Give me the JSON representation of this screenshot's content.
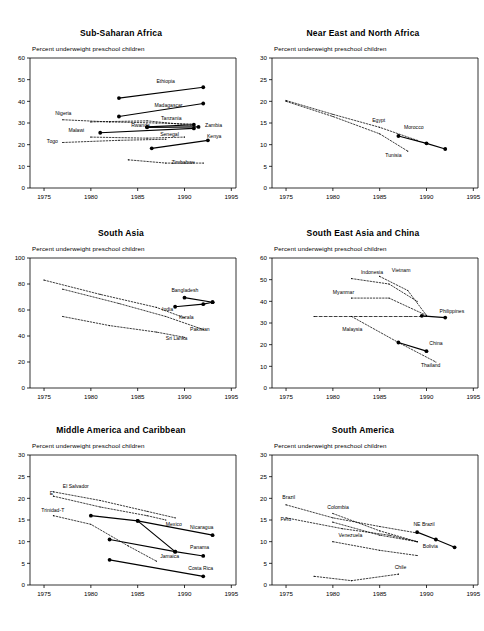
{
  "figure": {
    "y_axis_note": "Percent underweight preschool children",
    "x_ticks": [
      "1975",
      "1980",
      "1985",
      "1990",
      "1995"
    ],
    "xlim": [
      1973.5,
      1995.5
    ],
    "colors": {
      "ink": "#000000",
      "paper": "#ffffff"
    }
  },
  "chart_data": [
    {
      "type": "line",
      "title": "Sub-Saharan Africa",
      "xlabel": "",
      "ylabel": "Percent underweight preschool children",
      "xlim": [
        1973.5,
        1995.5
      ],
      "ylim": [
        0,
        60
      ],
      "yticks": [
        0,
        10,
        20,
        30,
        40,
        50,
        60
      ],
      "xticks": [
        1975,
        1980,
        1985,
        1990,
        1995
      ],
      "grid": false,
      "legend": "inline-labels",
      "series": [
        {
          "name": "Ethiopia",
          "style": "solid",
          "x": [
            1983,
            1992
          ],
          "values": [
            41.5,
            46.5
          ]
        },
        {
          "name": "Madagascar",
          "style": "solid",
          "x": [
            1983,
            1992
          ],
          "values": [
            33.0,
            39.0
          ]
        },
        {
          "name": "Tanzania",
          "style": "dotted",
          "x": [
            1980,
            1986,
            1991
          ],
          "values": [
            30.5,
            31.0,
            28.8
          ]
        },
        {
          "name": "Rwanda",
          "style": "solid",
          "x": [
            1986,
            1991
          ],
          "values": [
            28.2,
            29.2
          ]
        },
        {
          "name": "Zambia",
          "style": "solid",
          "x": [
            1986,
            1991.5
          ],
          "values": [
            28.0,
            28.2
          ]
        },
        {
          "name": "Nigeria",
          "style": "dotted",
          "x": [
            1977,
            1982,
            1987,
            1991
          ],
          "values": [
            31.5,
            30.5,
            30.0,
            29.5
          ]
        },
        {
          "name": "Malawi",
          "style": "solid",
          "x": [
            1981,
            1991
          ],
          "values": [
            25.5,
            27.5
          ]
        },
        {
          "name": "Senegal",
          "style": "dotted",
          "x": [
            1980,
            1986,
            1990
          ],
          "values": [
            23.5,
            23.0,
            23.5
          ]
        },
        {
          "name": "Kenya",
          "style": "solid",
          "x": [
            1986.5,
            1992.5
          ],
          "values": [
            18.3,
            22.0
          ]
        },
        {
          "name": "Togo",
          "style": "dotted",
          "x": [
            1977,
            1983,
            1988
          ],
          "values": [
            21.0,
            22.0,
            22.5
          ]
        },
        {
          "name": "Zimbabwe",
          "style": "dotted",
          "x": [
            1984,
            1988,
            1992
          ],
          "values": [
            13.0,
            11.5,
            11.5
          ]
        }
      ]
    },
    {
      "type": "line",
      "title": "Near East and North Africa",
      "xlabel": "",
      "ylabel": "Percent underweight preschool children",
      "xlim": [
        1973.5,
        1995.5
      ],
      "ylim": [
        0,
        30
      ],
      "yticks": [
        0,
        5,
        10,
        15,
        20,
        25,
        30
      ],
      "xticks": [
        1975,
        1980,
        1985,
        1990,
        1995
      ],
      "grid": false,
      "legend": "inline-labels",
      "series": [
        {
          "name": "Egypt",
          "style": "dotted",
          "x": [
            1975,
            1980,
            1985,
            1989
          ],
          "values": [
            20.2,
            17.0,
            14.0,
            11.0
          ]
        },
        {
          "name": "Morocco",
          "style": "solid",
          "x": [
            1987,
            1990,
            1992
          ],
          "values": [
            12.0,
            10.3,
            9.0
          ]
        },
        {
          "name": "Tunisia",
          "style": "dotted",
          "x": [
            1975,
            1980,
            1985,
            1988
          ],
          "values": [
            20.0,
            16.5,
            12.5,
            8.5
          ]
        }
      ]
    },
    {
      "type": "line",
      "title": "South Asia",
      "xlabel": "",
      "ylabel": "Percent underweight preschool children",
      "xlim": [
        1973.5,
        1995.5
      ],
      "ylim": [
        0,
        100
      ],
      "yticks": [
        0,
        20,
        40,
        60,
        80,
        100
      ],
      "xticks": [
        1975,
        1980,
        1985,
        1990,
        1995
      ],
      "grid": false,
      "legend": "inline-labels",
      "series": [
        {
          "name": "Bangladesh",
          "style": "solid",
          "x": [
            1990,
            1993
          ],
          "values": [
            69.5,
            66.0
          ]
        },
        {
          "name": "India",
          "style": "solid",
          "x": [
            1989,
            1992,
            1993
          ],
          "values": [
            62.5,
            64.5,
            66.0
          ]
        },
        {
          "name": "Kerala",
          "style": "dotted",
          "x": [
            1975,
            1981,
            1987,
            1990
          ],
          "values": [
            83.0,
            72.0,
            62.0,
            54.0
          ]
        },
        {
          "name": "Pakistan",
          "style": "dotted",
          "x": [
            1977,
            1983,
            1988,
            1992
          ],
          "values": [
            76.0,
            65.0,
            55.0,
            45.0
          ]
        },
        {
          "name": "Sri Lanka",
          "style": "dotted",
          "x": [
            1977,
            1982,
            1987,
            1990
          ],
          "values": [
            55.0,
            48.0,
            43.0,
            39.0
          ]
        }
      ]
    },
    {
      "type": "line",
      "title": "South East Asia and China",
      "xlabel": "",
      "ylabel": "Percent underweight preschool children",
      "xlim": [
        1973.5,
        1995.5
      ],
      "ylim": [
        0,
        60
      ],
      "yticks": [
        0,
        10,
        20,
        30,
        40,
        50,
        60
      ],
      "xticks": [
        1975,
        1980,
        1985,
        1990,
        1995
      ],
      "grid": false,
      "legend": "inline-labels",
      "series": [
        {
          "name": "Indonesia",
          "style": "dotted",
          "x": [
            1982,
            1986,
            1989
          ],
          "values": [
            50.5,
            48.0,
            40.0
          ]
        },
        {
          "name": "Vietnam",
          "style": "dotted",
          "x": [
            1985,
            1988,
            1990
          ],
          "values": [
            51.5,
            45.0,
            33.5
          ]
        },
        {
          "name": "Myanmar",
          "style": "dotted",
          "x": [
            1982,
            1986,
            1990
          ],
          "values": [
            41.5,
            41.5,
            33.5
          ]
        },
        {
          "name": "Philippines",
          "style": "solid",
          "x": [
            1989.5,
            1992
          ],
          "values": [
            33.3,
            32.5
          ]
        },
        {
          "name": "Malaysia",
          "style": "dashed",
          "x": [
            1978,
            1983,
            1988,
            1990
          ],
          "values": [
            33.0,
            33.0,
            33.0,
            33.0
          ]
        },
        {
          "name": "China",
          "style": "solid",
          "x": [
            1987,
            1990
          ],
          "values": [
            21.0,
            17.0
          ]
        },
        {
          "name": "Thailand",
          "style": "dotted",
          "x": [
            1982,
            1987,
            1991
          ],
          "values": [
            33.0,
            21.0,
            12.0
          ]
        }
      ]
    },
    {
      "type": "line",
      "title": "Middle America and Caribbean",
      "xlabel": "",
      "ylabel": "Percent underweight preschool children",
      "xlim": [
        1973.5,
        1995.5
      ],
      "ylim": [
        0,
        30
      ],
      "yticks": [
        0,
        5,
        10,
        15,
        20,
        25,
        30
      ],
      "xticks": [
        1975,
        1980,
        1985,
        1990,
        1995
      ],
      "grid": false,
      "legend": "inline-labels",
      "series": [
        {
          "name": "El Salvador",
          "style": "dotted",
          "x": [
            1976,
            1981,
            1986,
            1989
          ],
          "values": [
            21.5,
            19.5,
            17.0,
            15.5
          ]
        },
        {
          "name": "Mexico",
          "style": "dotted",
          "x": [
            1976,
            1981,
            1986,
            1988
          ],
          "values": [
            20.5,
            18.0,
            16.0,
            15.0
          ]
        },
        {
          "name": "Trinidad-T",
          "style": "dotted",
          "x": [
            1976,
            1980,
            1984,
            1987
          ],
          "values": [
            16.0,
            14.0,
            9.0,
            5.5
          ]
        },
        {
          "name": "Nicaragua",
          "style": "solid",
          "x": [
            1980,
            1985,
            1993
          ],
          "values": [
            16.0,
            14.8,
            11.5
          ]
        },
        {
          "name": "Panama",
          "style": "solid",
          "x": [
            1982,
            1989,
            1992
          ],
          "values": [
            10.5,
            7.7,
            6.7
          ]
        },
        {
          "name": "Jamaica",
          "style": "solid",
          "x": [
            1985,
            1989
          ],
          "values": [
            14.8,
            7.7
          ]
        },
        {
          "name": "Costa Rica",
          "style": "solid",
          "x": [
            1982,
            1992
          ],
          "values": [
            5.8,
            2.0
          ]
        }
      ]
    },
    {
      "type": "line",
      "title": "South America",
      "xlabel": "",
      "ylabel": "Percent underweight preschool children",
      "xlim": [
        1973.5,
        1995.5
      ],
      "ylim": [
        0,
        30
      ],
      "yticks": [
        0,
        5,
        10,
        15,
        20,
        25,
        30
      ],
      "xticks": [
        1975,
        1980,
        1985,
        1990,
        1995
      ],
      "grid": false,
      "legend": "inline-labels",
      "series": [
        {
          "name": "Brazil",
          "style": "dotted",
          "x": [
            1975,
            1980,
            1985,
            1989
          ],
          "values": [
            18.5,
            15.5,
            13.5,
            12.0
          ]
        },
        {
          "name": "Colombia",
          "style": "dotted",
          "x": [
            1980,
            1985,
            1989
          ],
          "values": [
            16.5,
            12.5,
            10.0
          ]
        },
        {
          "name": "Peru",
          "style": "dotted",
          "x": [
            1975,
            1981,
            1986,
            1989
          ],
          "values": [
            15.5,
            13.0,
            11.5,
            10.0
          ]
        },
        {
          "name": "Venezuela",
          "style": "dotted",
          "x": [
            1980,
            1985,
            1989
          ],
          "values": [
            10.0,
            8.0,
            6.8
          ]
        },
        {
          "name": "NE Brazil",
          "style": "solid",
          "x": [
            1989,
            1991,
            1993
          ],
          "values": [
            12.2,
            10.5,
            8.7
          ]
        },
        {
          "name": "Bolivia",
          "style": "dotted",
          "x": [
            1980,
            1985,
            1989
          ],
          "values": [
            14.5,
            11.5,
            10.0
          ]
        },
        {
          "name": "Chile",
          "style": "dotted",
          "x": [
            1978,
            1982,
            1987
          ],
          "values": [
            2.0,
            1.0,
            2.5
          ]
        }
      ]
    }
  ],
  "panels": [
    {
      "key": "sub-saharan-africa",
      "labels": [
        {
          "text": "Ethiopia",
          "x": 1987.0,
          "y": 48.5
        },
        {
          "text": "Madagascar",
          "x": 1986.8,
          "y": 37.5
        },
        {
          "text": "Tanzania",
          "x": 1987.5,
          "y": 31.5
        },
        {
          "text": "Rwanda",
          "x": 1984.3,
          "y": 28.0
        },
        {
          "text": "Zambia",
          "x": 1992.2,
          "y": 28.2
        },
        {
          "text": "Nigeria",
          "x": 1976.2,
          "y": 33.5
        },
        {
          "text": "Malawi",
          "x": 1977.6,
          "y": 26.0
        },
        {
          "text": "Senegal",
          "x": 1987.4,
          "y": 23.8
        },
        {
          "text": "Kenya",
          "x": 1992.4,
          "y": 23.2
        },
        {
          "text": "Togo",
          "x": 1975.3,
          "y": 21.0
        },
        {
          "text": "Zimbabwe",
          "x": 1988.6,
          "y": 11.0
        }
      ]
    },
    {
      "key": "near-east-north-africa",
      "labels": [
        {
          "text": "Egypt",
          "x": 1984.2,
          "y": 15.2
        },
        {
          "text": "Morocco",
          "x": 1987.6,
          "y": 13.6
        },
        {
          "text": "Tunisia",
          "x": 1985.6,
          "y": 7.2
        }
      ]
    },
    {
      "key": "south-asia",
      "labels": [
        {
          "text": "Bangladesh",
          "x": 1988.6,
          "y": 74.0
        },
        {
          "text": "India",
          "x": 1987.6,
          "y": 59.0
        },
        {
          "text": "Kerala",
          "x": 1989.4,
          "y": 53.0
        },
        {
          "text": "Pakistan",
          "x": 1990.6,
          "y": 44.0
        },
        {
          "text": "Sri Lanka",
          "x": 1988.0,
          "y": 37.0
        }
      ]
    },
    {
      "key": "south-east-asia-china",
      "labels": [
        {
          "text": "Indonesia",
          "x": 1983.0,
          "y": 52.5
        },
        {
          "text": "Vietnam",
          "x": 1986.3,
          "y": 53.5
        },
        {
          "text": "Myanmar",
          "x": 1980.0,
          "y": 43.5
        },
        {
          "text": "Philippines",
          "x": 1991.4,
          "y": 34.8
        },
        {
          "text": "Malaysia",
          "x": 1981.0,
          "y": 26.5
        },
        {
          "text": "China",
          "x": 1990.3,
          "y": 20.0
        },
        {
          "text": "Thailand",
          "x": 1989.4,
          "y": 9.8
        }
      ]
    },
    {
      "key": "middle-america-caribbean",
      "labels": [
        {
          "text": "El Salvador",
          "x": 1977.0,
          "y": 22.5
        },
        {
          "text": "E",
          "x": 1975.6,
          "y": 20.8
        },
        {
          "text": "Trinidad-T",
          "x": 1974.7,
          "y": 16.8
        },
        {
          "text": "Mexico",
          "x": 1988.0,
          "y": 13.7
        },
        {
          "text": "Nicaragua",
          "x": 1990.6,
          "y": 13.0
        },
        {
          "text": "Panama",
          "x": 1990.6,
          "y": 8.4
        },
        {
          "text": "Jamaica",
          "x": 1987.4,
          "y": 6.3
        },
        {
          "text": "Costa Rica",
          "x": 1990.4,
          "y": 3.5
        }
      ]
    },
    {
      "key": "south-america",
      "labels": [
        {
          "text": "Brazil",
          "x": 1974.6,
          "y": 19.8
        },
        {
          "text": "Colombia",
          "x": 1979.4,
          "y": 17.6
        },
        {
          "text": "Peru",
          "x": 1974.4,
          "y": 14.8
        },
        {
          "text": "Venezuela",
          "x": 1980.6,
          "y": 11.0
        },
        {
          "text": "NE Brazil",
          "x": 1988.6,
          "y": 13.6
        },
        {
          "text": "Bolivia",
          "x": 1989.6,
          "y": 8.6
        },
        {
          "text": "Chile",
          "x": 1986.6,
          "y": 3.6
        }
      ]
    }
  ]
}
